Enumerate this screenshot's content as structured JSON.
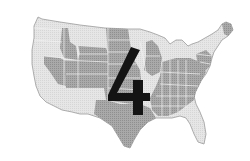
{
  "image": {
    "subject": "United States map with states shaded in two tones of gray",
    "overlay_numeral": "4"
  },
  "colors": {
    "background": "#ffffff",
    "light_state": "#e4e4e4",
    "dark_state": "#a8a8a8",
    "border": "#f4f4f4",
    "outline": "#9a9a9a",
    "numeral": "#141414"
  }
}
